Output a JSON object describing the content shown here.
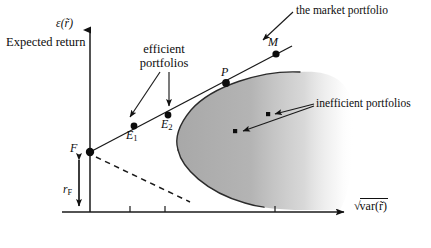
{
  "figure": {
    "title_shown": false,
    "background_color": "#ffffff",
    "ink_color": "#111111",
    "region_fill_color": "#b4b4b4"
  },
  "axes": {
    "y": {
      "symbol_label": "ε(r̃)",
      "text_label": "Expected return",
      "arrow_head": "up",
      "origin_px": [
        90,
        212
      ],
      "top_px": [
        90,
        27
      ]
    },
    "x": {
      "symbol_label": "√var(r̃)",
      "radical": "√",
      "radicand": "var(r̃)",
      "arrow_head": "right",
      "ticks": [
        130,
        165,
        275
      ],
      "origin_px": [
        62,
        212
      ],
      "end_px": [
        350,
        212
      ]
    }
  },
  "points": [
    {
      "name": "F",
      "label": "F",
      "x_px": 90,
      "y_px": 152,
      "marker": "dot",
      "size": 4.2
    },
    {
      "name": "E1",
      "label": "E",
      "sub": "1",
      "x_px": 134,
      "y_px": 126,
      "marker": "dot",
      "size": 3.4
    },
    {
      "name": "E2",
      "label": "E",
      "sub": "2",
      "x_px": 168,
      "y_px": 115,
      "marker": "dot",
      "size": 3.4
    },
    {
      "name": "P",
      "label": "P",
      "x_px": 226,
      "y_px": 83,
      "marker": "dot",
      "size": 3.8
    },
    {
      "name": "M",
      "label": "M",
      "x_px": 276,
      "y_px": 54,
      "marker": "dot",
      "size": 3.6
    },
    {
      "name": "inefficient-1",
      "label": "",
      "x_px": 268,
      "y_px": 114,
      "marker": "small-dot",
      "size": 2.1
    },
    {
      "name": "inefficient-2",
      "label": "",
      "x_px": 235,
      "y_px": 131,
      "marker": "small-dot",
      "size": 2.1
    }
  ],
  "annotations": {
    "market_portfolio": "the market portfolio",
    "efficient_portfolios": "efficient portfolios",
    "inefficient_portfolios": "inefficient portfolios",
    "expected_return": "Expected return",
    "risk_free_rate": "r",
    "risk_free_rate_sub": "F"
  },
  "lines": {
    "capital_market_line": {
      "description": "solid line from F through E1, E2, P to M",
      "from_px": [
        90,
        152
      ],
      "to_px": [
        291,
        47
      ]
    },
    "dashed_line": {
      "description": "dashed line descending from F to lower right",
      "from_px": [
        95,
        156
      ],
      "to_px": [
        188,
        201
      ]
    },
    "rf_measure": {
      "description": "double headed vertical arrow from F level to x axis",
      "x_px": 79,
      "top_px": 156,
      "bottom_px": 210
    }
  },
  "feasible_region": {
    "description": "shaded parabolic feasible set opening to the right, fading out at right edge",
    "vertex_px": [
      178,
      146
    ],
    "upper_boundary_end_px": [
      300,
      72
    ],
    "lower_boundary_end_px": [
      262,
      207
    ]
  }
}
